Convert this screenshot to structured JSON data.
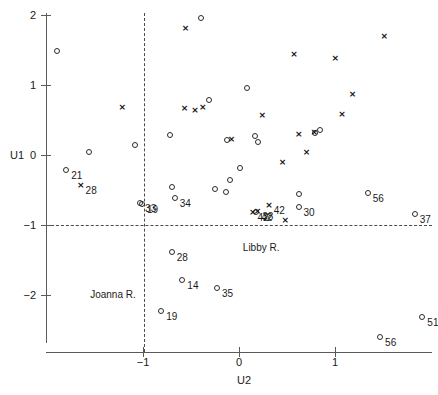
{
  "chart_data": {
    "type": "scatter",
    "title": "",
    "xlabel": "U2",
    "ylabel": "U1",
    "xlim": [
      -1.98,
      2.0
    ],
    "ylim": [
      -2.65,
      2.1
    ],
    "grid": false,
    "legend": null,
    "xticks": [
      -1,
      0,
      1
    ],
    "xticklabels": [
      "-1",
      "0",
      "1"
    ],
    "yticks": [
      2,
      1,
      0,
      -1,
      -2
    ],
    "yticklabels": [
      "2",
      "1",
      "0",
      "-1",
      "-2"
    ],
    "reference_lines": [
      {
        "orientation": "vertical",
        "value": -1,
        "style": "dashed"
      },
      {
        "orientation": "horizontal",
        "value": -1,
        "style": "dashed"
      }
    ],
    "annotations": [
      {
        "text": "Joanna R.",
        "x": -1.55,
        "y": -1.93
      },
      {
        "text": "Libby R.",
        "x": 0.04,
        "y": -1.26
      }
    ],
    "series": [
      {
        "name": "circle",
        "marker": "circle",
        "points": [
          {
            "x": -1.9,
            "y": 1.49,
            "label": ""
          },
          {
            "x": -1.8,
            "y": -0.21,
            "label": "21"
          },
          {
            "x": -1.56,
            "y": 0.04,
            "label": ""
          },
          {
            "x": -1.08,
            "y": 0.14,
            "label": ""
          },
          {
            "x": -1.03,
            "y": -0.68,
            "label": "33"
          },
          {
            "x": -1.01,
            "y": -0.7,
            "label": "19"
          },
          {
            "x": -0.72,
            "y": 0.28,
            "label": ""
          },
          {
            "x": -0.7,
            "y": -0.45,
            "label": ""
          },
          {
            "x": -0.67,
            "y": -0.61,
            "label": "34"
          },
          {
            "x": -0.7,
            "y": -1.39,
            "label": "28"
          },
          {
            "x": -0.59,
            "y": -1.78,
            "label": "14"
          },
          {
            "x": -0.81,
            "y": -2.23,
            "label": "19"
          },
          {
            "x": -0.23,
            "y": -1.9,
            "label": "35"
          },
          {
            "x": -0.4,
            "y": 1.96,
            "label": ""
          },
          {
            "x": -0.31,
            "y": 0.78,
            "label": ""
          },
          {
            "x": -0.12,
            "y": 0.21,
            "label": ""
          },
          {
            "x": 0.08,
            "y": 0.96,
            "label": ""
          },
          {
            "x": 0.17,
            "y": 0.27,
            "label": ""
          },
          {
            "x": 0.2,
            "y": 0.18,
            "label": ""
          },
          {
            "x": 0.01,
            "y": -0.18,
            "label": ""
          },
          {
            "x": -0.09,
            "y": -0.36,
            "label": ""
          },
          {
            "x": -0.25,
            "y": -0.48,
            "label": ""
          },
          {
            "x": -0.14,
            "y": -0.53,
            "label": ""
          },
          {
            "x": 0.18,
            "y": -0.81,
            "label": "42"
          },
          {
            "x": 0.62,
            "y": -0.56,
            "label": ""
          },
          {
            "x": 0.62,
            "y": -0.74,
            "label": "30"
          },
          {
            "x": 0.79,
            "y": 0.31,
            "label": ""
          },
          {
            "x": 0.84,
            "y": 0.36,
            "label": ""
          },
          {
            "x": 1.34,
            "y": -0.54,
            "label": "56"
          },
          {
            "x": 1.83,
            "y": -0.84,
            "label": "37"
          },
          {
            "x": 1.91,
            "y": -2.31,
            "label": "51"
          },
          {
            "x": 1.47,
            "y": -2.6,
            "label": "56"
          }
        ]
      },
      {
        "name": "cross",
        "marker": "cross",
        "points": [
          {
            "x": -1.65,
            "y": -0.43,
            "label": "28"
          },
          {
            "x": -1.22,
            "y": 0.68,
            "label": ""
          },
          {
            "x": -0.57,
            "y": 0.66,
            "label": ""
          },
          {
            "x": -0.46,
            "y": 0.63,
            "label": ""
          },
          {
            "x": -0.38,
            "y": 0.68,
            "label": ""
          },
          {
            "x": -0.56,
            "y": 1.81,
            "label": ""
          },
          {
            "x": -0.08,
            "y": 0.22,
            "label": ""
          },
          {
            "x": 0.62,
            "y": 0.3,
            "label": ""
          },
          {
            "x": 0.78,
            "y": 0.32,
            "label": ""
          },
          {
            "x": 0.7,
            "y": 0.04,
            "label": ""
          },
          {
            "x": 0.45,
            "y": -0.11,
            "label": ""
          },
          {
            "x": 0.24,
            "y": 0.57,
            "label": ""
          },
          {
            "x": 0.57,
            "y": 1.43,
            "label": ""
          },
          {
            "x": 1.0,
            "y": 1.38,
            "label": ""
          },
          {
            "x": 1.07,
            "y": 0.58,
            "label": ""
          },
          {
            "x": 1.51,
            "y": 1.7,
            "label": ""
          },
          {
            "x": 1.18,
            "y": 0.86,
            "label": ""
          },
          {
            "x": 0.19,
            "y": -0.8,
            "label": "38"
          },
          {
            "x": 0.31,
            "y": -0.72,
            "label": "42"
          },
          {
            "x": 0.48,
            "y": -0.94,
            "label": ""
          },
          {
            "x": 0.14,
            "y": -0.82,
            "label": "42"
          }
        ]
      }
    ]
  },
  "axis": {
    "y_title": "U1",
    "x_title": "U2"
  }
}
